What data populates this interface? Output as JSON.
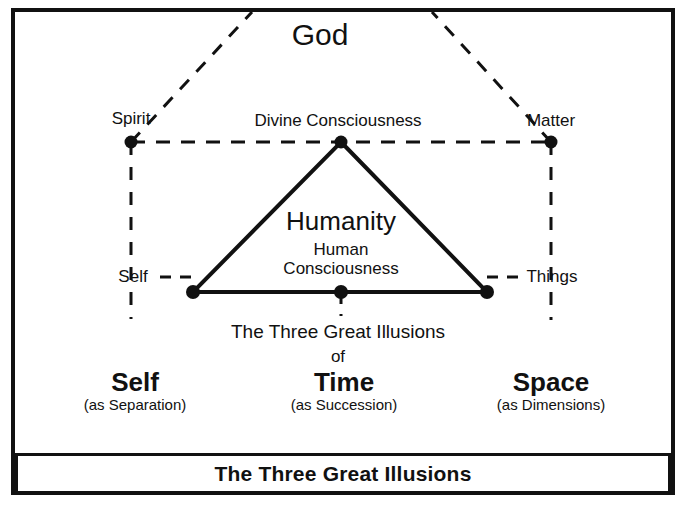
{
  "diagram": {
    "title": "The Three Great Illusions",
    "type": "concept-diagram",
    "colors": {
      "ink": "#111111",
      "background": "#ffffff"
    },
    "top_label": "God",
    "apex_label": "Divine Consciousness",
    "left_upper_label": "Spirit",
    "right_upper_label": "Matter",
    "left_lower_label": "Self",
    "right_lower_label": "Things",
    "center_primary": "Humanity",
    "center_secondary_line1": "Human",
    "center_secondary_line2": "Consciousness",
    "caption_line1": "The Three Great Illusions",
    "caption_line2": "of",
    "illusions": [
      {
        "name": "Self",
        "qualifier": "(as Separation)"
      },
      {
        "name": "Time",
        "qualifier": "(as Succession)"
      },
      {
        "name": "Space",
        "qualifier": "(as Dimensions)"
      }
    ]
  },
  "banner": {
    "text": "The Three Great Illusions"
  }
}
